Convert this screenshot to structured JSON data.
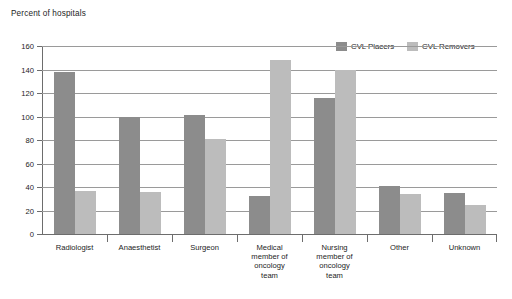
{
  "chart_data": {
    "type": "bar",
    "title": "Percent of hospitals",
    "xlabel": "",
    "ylabel": "Percent of hospitals",
    "ylim": [
      0,
      160
    ],
    "ytick_step": 20,
    "yticks": [
      "0",
      "20",
      "40",
      "60",
      "80",
      "100",
      "120",
      "140",
      "160"
    ],
    "grid": true,
    "legend_position": "top-right",
    "categories": [
      "Radiologist",
      "Anaesthetist",
      "Surgeon",
      "Medical member of oncology team",
      "Nursing member of oncology team",
      "Other",
      "Unknown"
    ],
    "category_lines": [
      [
        "Radiologist"
      ],
      [
        "Anaesthetist"
      ],
      [
        "Surgeon"
      ],
      [
        "Medical",
        "member of",
        "oncology",
        "team"
      ],
      [
        "Nursing",
        "member of",
        "oncology",
        "team"
      ],
      [
        "Other"
      ],
      [
        "Unknown"
      ]
    ],
    "series": [
      {
        "name": "CVL Placers",
        "color": "#8c8c8c",
        "values": [
          138,
          100,
          101,
          32,
          116,
          41,
          35
        ]
      },
      {
        "name": "CVL Removers",
        "color": "#bcbcbc",
        "values": [
          37,
          36,
          81,
          148,
          140,
          34,
          25
        ]
      }
    ]
  },
  "caption": {
    "text": ""
  }
}
